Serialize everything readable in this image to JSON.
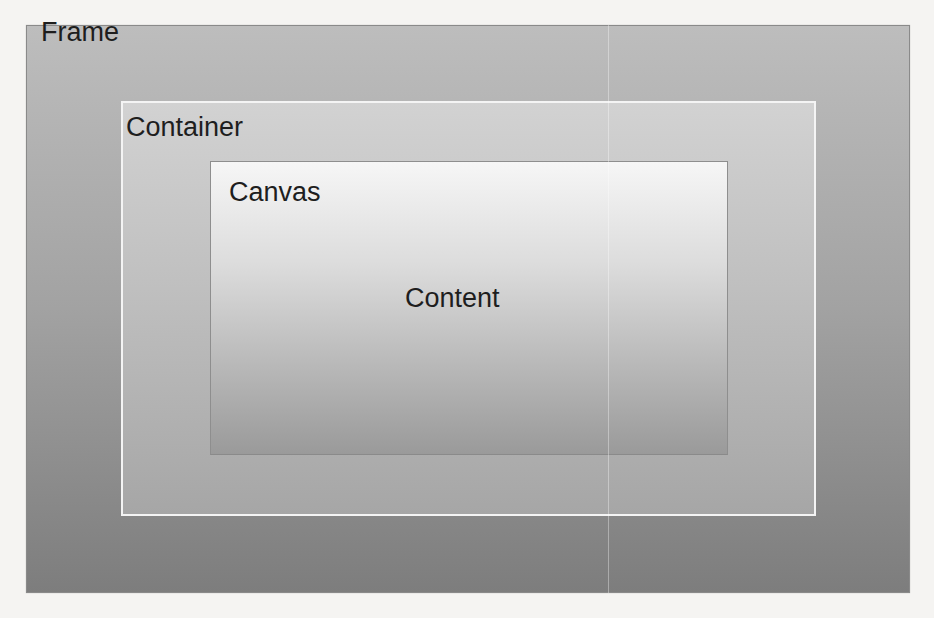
{
  "diagram": {
    "type": "nested-boxes",
    "layers": [
      {
        "id": "frame",
        "label": "Frame",
        "gradient": [
          "#bdbdbd",
          "#7d7d7d"
        ],
        "border": "#8a8a8a"
      },
      {
        "id": "container",
        "label": "Container",
        "gradient": [
          "#d2d2d2",
          "#a6a6a6"
        ],
        "border": "#f4f4f4"
      },
      {
        "id": "canvas",
        "label": "Canvas",
        "gradient": [
          "#f6f6f6",
          "#9a9a9a"
        ],
        "border": "#8e8e8e"
      }
    ],
    "center_label": "Content"
  },
  "colors": {
    "page_background": "#f5f4f2",
    "label_text": "#1e1e1e"
  }
}
